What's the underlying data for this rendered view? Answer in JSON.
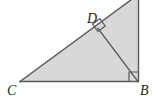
{
  "figure": {
    "type": "geometry-diagram",
    "width": 157,
    "height": 105,
    "background_color": "#ffffff",
    "fill_color": "#d8d8d8",
    "stroke_color": "#58595b",
    "label_color": "#231f20",
    "stroke_width": 1.4,
    "labels": [
      {
        "id": "C",
        "text": "C",
        "x": 7,
        "y": 84
      },
      {
        "id": "B",
        "text": "B",
        "x": 140,
        "y": 84
      },
      {
        "id": "D",
        "text": "D",
        "x": 87,
        "y": 12
      }
    ],
    "points": {
      "A": {
        "x": 139,
        "y": -6
      },
      "B": {
        "x": 138,
        "y": 81.5
      },
      "C": {
        "x": 20,
        "y": 81.5
      },
      "D": {
        "x": 98,
        "y": 28.5
      }
    },
    "outline_path": "M 20 81.5 L 139 -6 L 139 81.5 Z",
    "altitude_path": "M 98 28.5 L 138 81.5",
    "base_path": "M 20 81.5 L 138 81.5",
    "vertical_path": "M 138.5 -6 L 138.5 81.5",
    "hypotenuse_path": "M 20 81.5 L 139 -6",
    "right_angle_marks": [
      {
        "at": "B",
        "path": "M 129 81 L 129 72 L 138 72",
        "size": 9
      },
      {
        "at": "D",
        "path": "M 92.6 24.1 L 99.9 18.7 L 105.2 26.0 L 97.9 31.4 Z",
        "size": 9
      }
    ]
  }
}
